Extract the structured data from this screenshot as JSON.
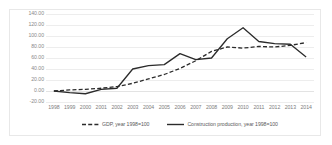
{
  "chart_data": {
    "type": "line",
    "title": "",
    "xlabel": "",
    "ylabel": "",
    "grid": true,
    "legend_position": "bottom",
    "ylim": [
      -20,
      140
    ],
    "ytick_step": 20,
    "yticks": [
      "140.00",
      "120.00",
      "100.00",
      "80.00",
      "60.00",
      "40.00",
      "20.00",
      "0.00",
      "-20.00"
    ],
    "ytick_values": [
      140,
      120,
      100,
      80,
      60,
      40,
      20,
      0,
      -20
    ],
    "categories": [
      "1998",
      "1999",
      "2000",
      "2001",
      "2002",
      "2003",
      "2004",
      "2005",
      "2006",
      "2007",
      "2008",
      "2009",
      "2010",
      "2011",
      "2012",
      "2013",
      "2014"
    ],
    "x": [
      1998,
      1999,
      2000,
      2001,
      2002,
      2003,
      2004,
      2005,
      2006,
      2007,
      2008,
      2009,
      2010,
      2011,
      2012,
      2013,
      2014
    ],
    "series": [
      {
        "name": "GDP, year 1998=100",
        "style": "dashed",
        "color": "#2b2b2b",
        "values": [
          0,
          2,
          3,
          5,
          8,
          14,
          22,
          30,
          41,
          55,
          72,
          80,
          78,
          81,
          80,
          83,
          88
        ]
      },
      {
        "name": "Construction production, year 1998=100",
        "style": "solid",
        "color": "#2b2b2b",
        "values": [
          0,
          -3,
          -5,
          3,
          5,
          40,
          46,
          48,
          68,
          57,
          60,
          95,
          115,
          90,
          86,
          85,
          62
        ]
      }
    ]
  },
  "legend": {
    "entries": [
      {
        "label": "GDP, year 1998=100",
        "style": "dashed"
      },
      {
        "label": "Construction production, year 1998=100",
        "style": "solid"
      }
    ]
  },
  "colors": {
    "line": "#2b2b2b",
    "grid": "#ededed",
    "axis_text": "#7d7d7d",
    "frame": "#e8e8e8",
    "background": "#ffffff"
  }
}
